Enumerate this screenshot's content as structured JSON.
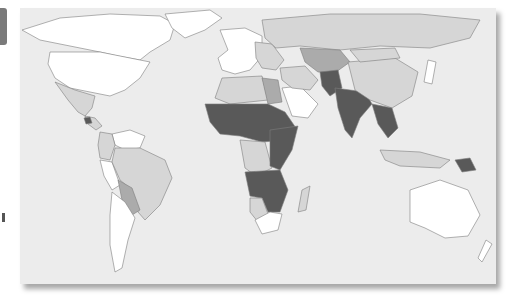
{
  "figure": {
    "type": "choropleth-world-map",
    "ocean_color": "#ececec",
    "border_color": "#7d7d7d",
    "legend_visible": false,
    "shade_classes": [
      {
        "id": "c0",
        "color": "#ffffff",
        "label": ""
      },
      {
        "id": "c1",
        "color": "#d6d6d6",
        "label": ""
      },
      {
        "id": "c2",
        "color": "#ababab",
        "label": ""
      },
      {
        "id": "c3",
        "color": "#595959",
        "label": ""
      }
    ]
  },
  "regions": [
    {
      "name": "Canada/Alaska",
      "class": "c0"
    },
    {
      "name": "Greenland",
      "class": "c0"
    },
    {
      "name": "United States",
      "class": "c0"
    },
    {
      "name": "Mexico",
      "class": "c1"
    },
    {
      "name": "Central America",
      "class": "c1"
    },
    {
      "name": "Guatemala",
      "class": "c3"
    },
    {
      "name": "Venezuela/Guianas",
      "class": "c0"
    },
    {
      "name": "Colombia/Ecuador",
      "class": "c1"
    },
    {
      "name": "Peru",
      "class": "c0"
    },
    {
      "name": "Brazil",
      "class": "c1"
    },
    {
      "name": "Bolivia/Paraguay",
      "class": "c2"
    },
    {
      "name": "Argentina/Chile",
      "class": "c0"
    },
    {
      "name": "Europe",
      "class": "c0"
    },
    {
      "name": "Eastern Europe",
      "class": "c1"
    },
    {
      "name": "Russia",
      "class": "c1"
    },
    {
      "name": "North Africa",
      "class": "c1"
    },
    {
      "name": "Egypt",
      "class": "c2"
    },
    {
      "name": "Arabian Peninsula",
      "class": "c0"
    },
    {
      "name": "Middle East",
      "class": "c1"
    },
    {
      "name": "Central Asia",
      "class": "c2"
    },
    {
      "name": "Afghanistan/Pakistan",
      "class": "c3"
    },
    {
      "name": "Sahel/West Africa",
      "class": "c3"
    },
    {
      "name": "Central Africa",
      "class": "c1"
    },
    {
      "name": "East Africa",
      "class": "c3"
    },
    {
      "name": "Southern Africa",
      "class": "c3"
    },
    {
      "name": "Namibia/Botswana",
      "class": "c1"
    },
    {
      "name": "South Africa",
      "class": "c0"
    },
    {
      "name": "Madagascar",
      "class": "c1"
    },
    {
      "name": "India",
      "class": "c3"
    },
    {
      "name": "China",
      "class": "c1"
    },
    {
      "name": "Mongolia",
      "class": "c1"
    },
    {
      "name": "Southeast Asia mainland",
      "class": "c3"
    },
    {
      "name": "Indonesia/Philippines",
      "class": "c1"
    },
    {
      "name": "Papua New Guinea",
      "class": "c3"
    },
    {
      "name": "Japan",
      "class": "c0"
    },
    {
      "name": "Australia",
      "class": "c0"
    },
    {
      "name": "New Zealand",
      "class": "c0"
    }
  ]
}
